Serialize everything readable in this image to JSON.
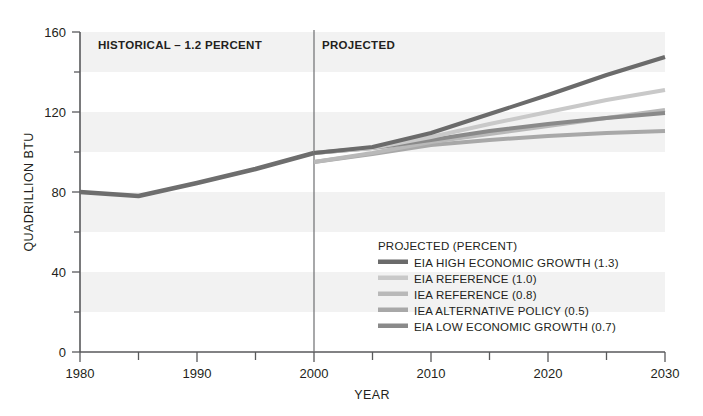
{
  "chart_data": {
    "type": "line",
    "title": "",
    "xlabel": "YEAR",
    "ylabel": "QUADRILLION BTU",
    "xlim": [
      1980,
      2030
    ],
    "ylim": [
      0,
      160
    ],
    "x_ticks_major": [
      1980,
      1990,
      2000,
      2010,
      2020,
      2030
    ],
    "x_ticks_minor": [
      1985,
      1995,
      2005,
      2015,
      2025
    ],
    "y_ticks_major": [
      0,
      40,
      80,
      120,
      160
    ],
    "y_ticks_minor": [
      20,
      60,
      100,
      140
    ],
    "x_tick_labels": [
      "1980",
      "1990",
      "2000",
      "2010",
      "2020",
      "2030"
    ],
    "y_tick_labels": [
      "0",
      "40",
      "80",
      "120",
      "160"
    ],
    "grid": "horizontal-bands",
    "legend_position": "inside-lower-right",
    "divider_year": 2000,
    "annotations": [
      {
        "name": "historical-label",
        "text": "HISTORICAL – 1.2 PERCENT",
        "x": 1990,
        "y": 152
      },
      {
        "name": "projected-label",
        "text": "PROJECTED",
        "x": 2004,
        "y": 152
      }
    ],
    "historical": {
      "name": "HISTORICAL",
      "color": "#6e6e6e",
      "x": [
        1980,
        1985,
        1990,
        1995,
        2000
      ],
      "values": [
        80.0,
        78.0,
        84.5,
        91.5,
        99.5
      ]
    },
    "series": [
      {
        "name": "EIA HIGH ECONOMIC GROWTH (1.3)",
        "color": "#6b6b6b",
        "x": [
          2000,
          2005,
          2010,
          2015,
          2020,
          2025,
          2030
        ],
        "values": [
          99.5,
          102.5,
          109.5,
          119.0,
          128.5,
          138.5,
          147.5
        ]
      },
      {
        "name": "EIA REFERENCE (1.0)",
        "color": "#c9c9c9",
        "x": [
          2000,
          2005,
          2010,
          2015,
          2020,
          2025,
          2030
        ],
        "values": [
          99.5,
          102.0,
          107.5,
          114.0,
          120.0,
          126.0,
          131.0
        ]
      },
      {
        "name": "IEA REFERENCE (0.8)",
        "color": "#b9b9b9",
        "x": [
          2000,
          2005,
          2010,
          2015,
          2020,
          2025,
          2030
        ],
        "values": [
          95.0,
          99.5,
          105.0,
          109.0,
          113.0,
          117.0,
          121.0
        ]
      },
      {
        "name": "IEA ALTERNATIVE POLICY (0.5)",
        "color": "#a8a8a8",
        "x": [
          2000,
          2005,
          2010,
          2015,
          2020,
          2025,
          2030
        ],
        "values": [
          95.0,
          99.0,
          103.5,
          106.0,
          108.0,
          109.5,
          110.5
        ]
      },
      {
        "name": "EIA LOW ECONOMIC GROWTH (0.7)",
        "color": "#8a8a8a",
        "x": [
          2000,
          2005,
          2010,
          2015,
          2020,
          2025,
          2030
        ],
        "values": [
          99.5,
          102.0,
          106.0,
          110.5,
          114.0,
          117.0,
          119.5
        ]
      }
    ]
  },
  "legend": {
    "title": "PROJECTED (PERCENT)",
    "items": [
      {
        "label": "EIA HIGH ECONOMIC GROWTH (1.3)",
        "color": "#6b6b6b"
      },
      {
        "label": "EIA REFERENCE (1.0)",
        "color": "#c9c9c9"
      },
      {
        "label": "IEA REFERENCE (0.8)",
        "color": "#b9b9b9"
      },
      {
        "label": "IEA ALTERNATIVE POLICY (0.5)",
        "color": "#a8a8a8"
      },
      {
        "label": "EIA LOW ECONOMIC GROWTH (0.7)",
        "color": "#8a8a8a"
      }
    ]
  },
  "axes": {
    "x_title": "YEAR",
    "y_title": "QUADRILLION BTU"
  },
  "colors": {
    "axis": "#58595b",
    "text": "#231f20",
    "band": "#f2f2f2",
    "divider": "#6d6e71"
  }
}
